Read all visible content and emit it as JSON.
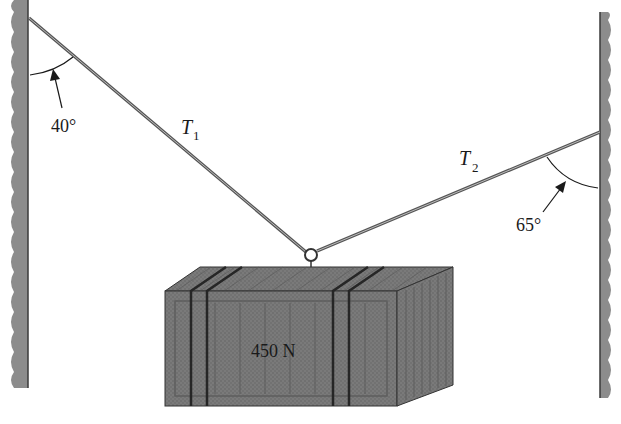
{
  "diagram": {
    "type": "static-equilibrium",
    "colors": {
      "wall": "#8a8a8a",
      "wall_edge": "#3a3a3a",
      "rope": "#555555",
      "crate_front": "#767676",
      "crate_top": "#8c8c8c",
      "crate_side": "#808080",
      "strap": "#2a2a2a",
      "text": "#1a1a1a"
    },
    "ropes": [
      {
        "name": "T",
        "subscript": "1",
        "angle_label": "40°",
        "attached_to": "left wall"
      },
      {
        "name": "T",
        "subscript": "2",
        "angle_label": "65°",
        "attached_to": "right wall"
      }
    ],
    "crate": {
      "weight_label": "450 N"
    }
  }
}
